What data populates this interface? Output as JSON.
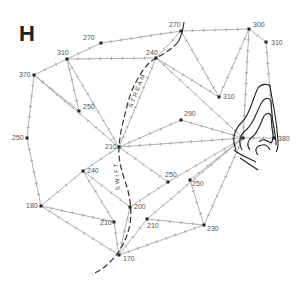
{
  "figure": {
    "panel_label": "H",
    "stream_labels": [
      "STREAM",
      "SWIFT"
    ],
    "nodes": [
      {
        "id": "n1",
        "label": "270",
        "x": 101,
        "y": 43,
        "lx": -18,
        "ly": -3
      },
      {
        "id": "n2",
        "label": "310",
        "x": 67,
        "y": 59,
        "lx": -10,
        "ly": -4
      },
      {
        "id": "n3",
        "label": "370",
        "x": 34,
        "y": 75,
        "lx": -15,
        "ly": 2
      },
      {
        "id": "n4",
        "label": "250",
        "x": 79,
        "y": 111,
        "lx": 4,
        "ly": -2
      },
      {
        "id": "n5",
        "label": "250",
        "x": 27,
        "y": 138,
        "lx": -15,
        "ly": 2
      },
      {
        "id": "n6",
        "label": "270",
        "x": 181,
        "y": 31,
        "lx": -12,
        "ly": -4
      },
      {
        "id": "n7",
        "label": "240",
        "x": 156,
        "y": 58,
        "lx": -10,
        "ly": -3
      },
      {
        "id": "n8",
        "label": "300",
        "x": 249,
        "y": 29,
        "lx": 4,
        "ly": -2
      },
      {
        "id": "n9",
        "label": "310",
        "x": 266,
        "y": 42,
        "lx": 5,
        "ly": 3
      },
      {
        "id": "n10",
        "label": "310",
        "x": 219,
        "y": 97,
        "lx": 4,
        "ly": 2
      },
      {
        "id": "n11",
        "label": "290",
        "x": 181,
        "y": 120,
        "lx": 3,
        "ly": -4
      },
      {
        "id": "n12",
        "label": "210",
        "x": 119,
        "y": 147,
        "lx": -14,
        "ly": 2
      },
      {
        "id": "n13",
        "label": "240",
        "x": 83,
        "y": 171,
        "lx": 4,
        "ly": 2
      },
      {
        "id": "n14",
        "label": "180",
        "x": 41,
        "y": 206,
        "lx": -15,
        "ly": 2
      },
      {
        "id": "n15",
        "label": "",
        "x": 243,
        "y": 138,
        "lx": 0,
        "ly": 0
      },
      {
        "id": "n16",
        "label": "380",
        "x": 274,
        "y": 138,
        "lx": 4,
        "ly": 3
      },
      {
        "id": "n17",
        "label": "250",
        "x": 168,
        "y": 182,
        "lx": -3,
        "ly": -5
      },
      {
        "id": "n18",
        "label": "250",
        "x": 190,
        "y": 180,
        "lx": 2,
        "ly": 6
      },
      {
        "id": "n19",
        "label": "200",
        "x": 130,
        "y": 207,
        "lx": 4,
        "ly": 2
      },
      {
        "id": "n20",
        "label": "210",
        "x": 114,
        "y": 222,
        "lx": -14,
        "ly": 3
      },
      {
        "id": "n21",
        "label": "210",
        "x": 147,
        "y": 219,
        "lx": 0,
        "ly": 9
      },
      {
        "id": "n22",
        "label": "230",
        "x": 204,
        "y": 225,
        "lx": 3,
        "ly": 6
      },
      {
        "id": "n23",
        "label": "170",
        "x": 119,
        "y": 255,
        "lx": 4,
        "ly": 6
      }
    ]
  }
}
